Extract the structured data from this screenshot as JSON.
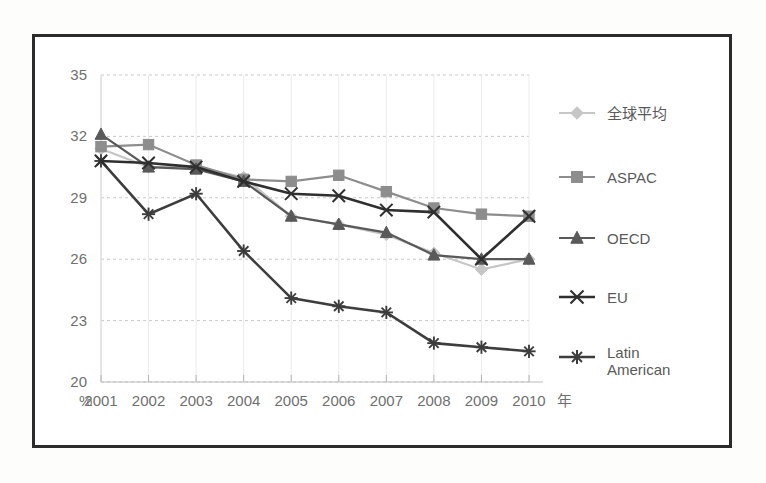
{
  "chart_data": {
    "type": "line",
    "title": "",
    "subtitle": "",
    "xlabel": "年",
    "ylabel": "%",
    "x": [
      2001,
      2002,
      2003,
      2004,
      2005,
      2006,
      2007,
      2008,
      2009,
      2010
    ],
    "categories": [
      "2001",
      "2002",
      "2003",
      "2004",
      "2005",
      "2006",
      "2007",
      "2008",
      "2009",
      "2010"
    ],
    "xtick_labels": [
      "2001",
      "2002",
      "2003",
      "2004",
      "2005",
      "2006",
      "2007",
      "2008",
      "2009",
      "2010"
    ],
    "ytick_labels": [
      "20",
      "23",
      "26",
      "29",
      "32",
      "35"
    ],
    "yticks": [
      20,
      23,
      26,
      29,
      32,
      35
    ],
    "ylim": [
      20,
      35
    ],
    "xlim": [
      2001,
      2010
    ],
    "grid": true,
    "grid_axis": "y",
    "legend_position": "right",
    "series": [
      {
        "name": "全球平均",
        "marker": "diamond",
        "color": "#c6c6c6",
        "values": [
          31.4,
          30.5,
          30.5,
          30.0,
          28.1,
          27.7,
          27.2,
          26.3,
          25.5,
          26.0
        ]
      },
      {
        "name": "ASPAC",
        "marker": "square",
        "color": "#8d8d8d",
        "values": [
          31.5,
          31.6,
          30.6,
          29.9,
          29.8,
          30.1,
          29.3,
          28.5,
          28.2,
          28.1
        ]
      },
      {
        "name": "OECD",
        "marker": "triangle",
        "color": "#595959",
        "values": [
          32.1,
          30.5,
          30.4,
          29.8,
          28.1,
          27.7,
          27.3,
          26.2,
          26.0,
          26.0
        ]
      },
      {
        "name": "EU",
        "marker": "x-cross",
        "color": "#2f2f2f",
        "values": [
          30.8,
          30.7,
          30.5,
          29.8,
          29.2,
          29.1,
          28.4,
          28.3,
          26.0,
          28.1
        ]
      },
      {
        "name": "Latin American",
        "marker": "asterisk",
        "color": "#3d3d3d",
        "values": [
          30.8,
          28.2,
          29.2,
          26.4,
          24.1,
          23.7,
          23.4,
          21.9,
          21.7,
          21.5
        ]
      }
    ]
  },
  "legend": {
    "items": [
      {
        "label": "全球平均"
      },
      {
        "label": "ASPAC"
      },
      {
        "label": "OECD"
      },
      {
        "label": "EU"
      },
      {
        "label": "Latin American",
        "line1": "Latin",
        "line2": "American"
      }
    ]
  },
  "axes": {
    "y_unit_label": "%",
    "x_unit_label": "年"
  }
}
